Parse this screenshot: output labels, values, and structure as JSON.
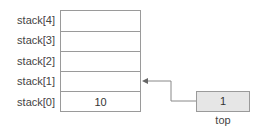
{
  "diagram": {
    "type": "stack-array",
    "stack": {
      "rows": [
        {
          "label": "stack[4]",
          "value": ""
        },
        {
          "label": "stack[3]",
          "value": ""
        },
        {
          "label": "stack[2]",
          "value": ""
        },
        {
          "label": "stack[1]",
          "value": ""
        },
        {
          "label": "stack[0]",
          "value": "10"
        }
      ]
    },
    "pointer": {
      "label": "top",
      "value": "1",
      "points_to": "stack[1]",
      "fill_color": "#e6e6e6"
    },
    "colors": {
      "border": "#9a9a9a",
      "arrow": "#888888",
      "text": "#333333"
    }
  }
}
